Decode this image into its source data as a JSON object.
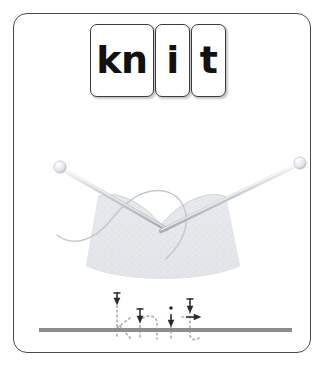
{
  "card": {
    "type": "phonics-tracing-flashcard",
    "word": "knit",
    "border_color": "#4a4a4a",
    "background_color": "#ffffff"
  },
  "phonemes": {
    "boxes": [
      {
        "label": "kn",
        "width": "wide"
      },
      {
        "label": "i",
        "width": "narrow"
      },
      {
        "label": "t",
        "width": "narrow"
      }
    ],
    "text_color": "#111111",
    "box_border_color": "#3c3c3c"
  },
  "illustration": {
    "name": "knitting-needles-with-knitted-fabric",
    "alt_text": "Two knitting needles crossed in a V shape holding a piece of light grey knitted fabric with a loose strand of yarn",
    "needle_color": "#c9cdd2",
    "needle_ball_color": "#eceef0",
    "fabric_color": "#dcdfe3",
    "yarn_color": "#c4c8cd",
    "parts": [
      "left-needle",
      "right-needle",
      "knitted-fabric",
      "yarn-strand"
    ]
  },
  "tracing": {
    "word": "knit",
    "letters": [
      "k",
      "n",
      "i",
      "t"
    ],
    "style": "dotted-outline-with-direction-arrows",
    "dot_color": "#b0b0b0",
    "arrow_color": "#2b2b2b",
    "arrow_count": 4
  },
  "baseline": {
    "label": "writing-baseline",
    "color": "#8d8d8d"
  }
}
